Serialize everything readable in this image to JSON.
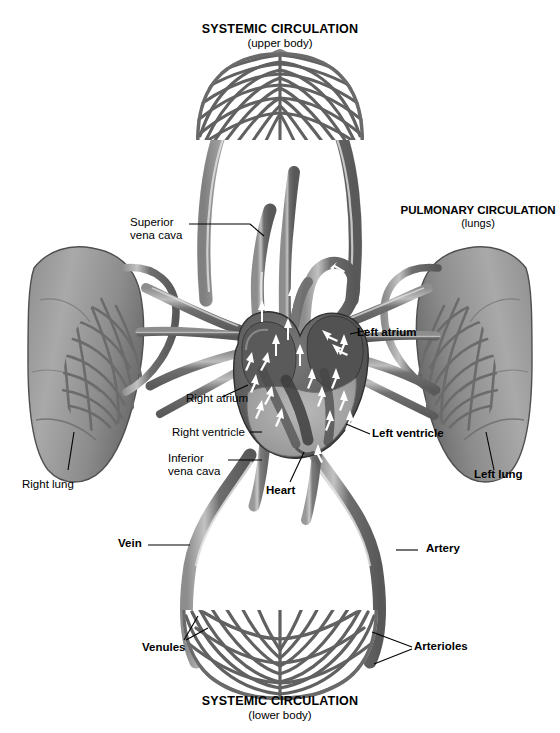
{
  "diagram": {
    "title_top": {
      "main": "SYSTEMIC CIRCULATION",
      "sub": "(upper body)"
    },
    "title_bottom": {
      "main": "SYSTEMIC CIRCULATION",
      "sub": "(lower body)"
    },
    "title_pulmonary": {
      "main": "PULMONARY CIRCULATION",
      "sub": "(lungs)"
    },
    "labels": {
      "superior_vena_cava_line1": "Superior",
      "superior_vena_cava_line2": "vena cava",
      "inferior_vena_cava_line1": "Inferior",
      "inferior_vena_cava_line2": "vena cava",
      "right_atrium": "Right atrium",
      "right_ventricle": "Right ventricle",
      "left_atrium": "Left atrium",
      "left_ventricle": "Left ventricle",
      "heart": "Heart",
      "right_lung": "Right lung",
      "left_lung": "Left lung",
      "vein": "Vein",
      "artery": "Artery",
      "venules": "Venules",
      "arterioles": "Arterioles"
    },
    "colors": {
      "background": "#ffffff",
      "vessel_dark": "#6d6d6d",
      "vessel_mid": "#8a8a8a",
      "vessel_light": "#b4b4b4",
      "vessel_highlight": "#f2f2f2",
      "lung_fill": "#9a9a9a",
      "lung_edge": "#5e5e5e",
      "heart_dark": "#4a4a4a",
      "heart_mid": "#6a6a6a",
      "heart_muscle": "#a8a8a8",
      "arrow_white": "#ffffff",
      "leader_line": "#000000",
      "text": "#000000"
    }
  }
}
